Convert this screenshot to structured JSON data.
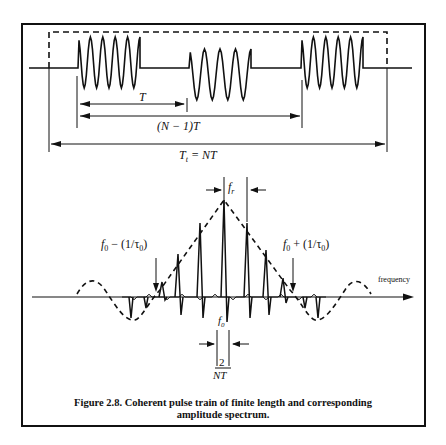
{
  "figure": {
    "caption_line1": "Figure 2.8. Coherent pulse train of finite length and corresponding",
    "caption_line2": "amplitude spectrum."
  },
  "time_domain": {
    "labels": {
      "period": "T",
      "n_minus_1_period": "(N − 1)T",
      "total_left": "T",
      "total_sub": "t",
      "total_right": " = NT"
    },
    "pulses": [
      {
        "start_x": 78,
        "end_x": 140,
        "cycles": 5,
        "high_y": 37,
        "low_y": 88
      },
      {
        "start_x": 189,
        "end_x": 251,
        "cycles": 4,
        "high_y": 49,
        "low_y": 100
      },
      {
        "start_x": 301,
        "end_x": 363,
        "cycles": 5,
        "high_y": 37,
        "low_y": 88
      }
    ]
  },
  "frequency_domain": {
    "axis_label": "frequency",
    "labels": {
      "fr": "f",
      "fr_sub": "r",
      "lower_main": "f",
      "lower_sub": "0",
      "lower_rest": " − (1/τ",
      "lower_sub2": "0",
      "lower_close": ")",
      "upper_main": "f",
      "upper_sub": "0",
      "upper_rest": " + (1/τ",
      "upper_sub2": "0",
      "upper_close": ")",
      "center_main": "f",
      "center_sub": "0",
      "width_num": "2",
      "width_den": "NT"
    }
  },
  "chart_data": {
    "type": "line",
    "title": "Coherent pulse train of finite length and corresponding amplitude spectrum",
    "xlabel": "frequency",
    "ylabel": "",
    "annotations": [
      "T",
      "(N-1)T",
      "T_t = NT",
      "f_r",
      "f_0 - (1/tau_0)",
      "f_0 + (1/tau_0)",
      "f_0",
      "2/NT"
    ],
    "series": [
      {
        "name": "spectral lines (relative amplitude)",
        "x": [
          -3,
          -2,
          -1,
          0,
          1,
          2,
          3
        ],
        "values": [
          0.45,
          0.74,
          0.9,
          1.0,
          0.74,
          0.45,
          0.15
        ]
      },
      {
        "name": "sinc envelope (dashed)",
        "x": [
          -6,
          -4.5,
          -3.5,
          0,
          3.5,
          4.5,
          6
        ],
        "values": [
          0.15,
          -0.25,
          0.0,
          1.0,
          0.0,
          -0.25,
          0.15
        ]
      }
    ],
    "grid": false
  }
}
